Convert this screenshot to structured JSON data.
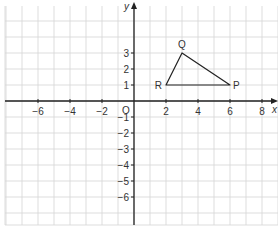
{
  "diagram": {
    "type": "coordinate-plane",
    "origin_label": "O",
    "axes": {
      "x": {
        "label": "x",
        "min": -8,
        "max": 9,
        "tick_labels": [
          "−6",
          "−4",
          "−2",
          "2",
          "4",
          "6",
          "8"
        ],
        "tick_values": [
          -6,
          -4,
          -2,
          2,
          4,
          6,
          8
        ]
      },
      "y": {
        "label": "y",
        "min": -7,
        "max": 6,
        "tick_labels": [
          "3",
          "2",
          "1",
          "−1",
          "−2",
          "−3",
          "−4",
          "−5",
          "−6"
        ],
        "tick_values": [
          3,
          2,
          1,
          -1,
          -2,
          -3,
          -4,
          -5,
          -6
        ]
      }
    },
    "grid": {
      "unit": 1,
      "visible": true
    },
    "shape": {
      "name": "triangle PQR",
      "vertices": [
        {
          "label": "P",
          "x": 6,
          "y": 1
        },
        {
          "label": "Q",
          "x": 3,
          "y": 3
        },
        {
          "label": "R",
          "x": 2,
          "y": 1
        }
      ]
    },
    "colors": {
      "grid": "#d4d4d4",
      "axis": "#222222",
      "text": "#333333",
      "background": "#ffffff"
    }
  }
}
